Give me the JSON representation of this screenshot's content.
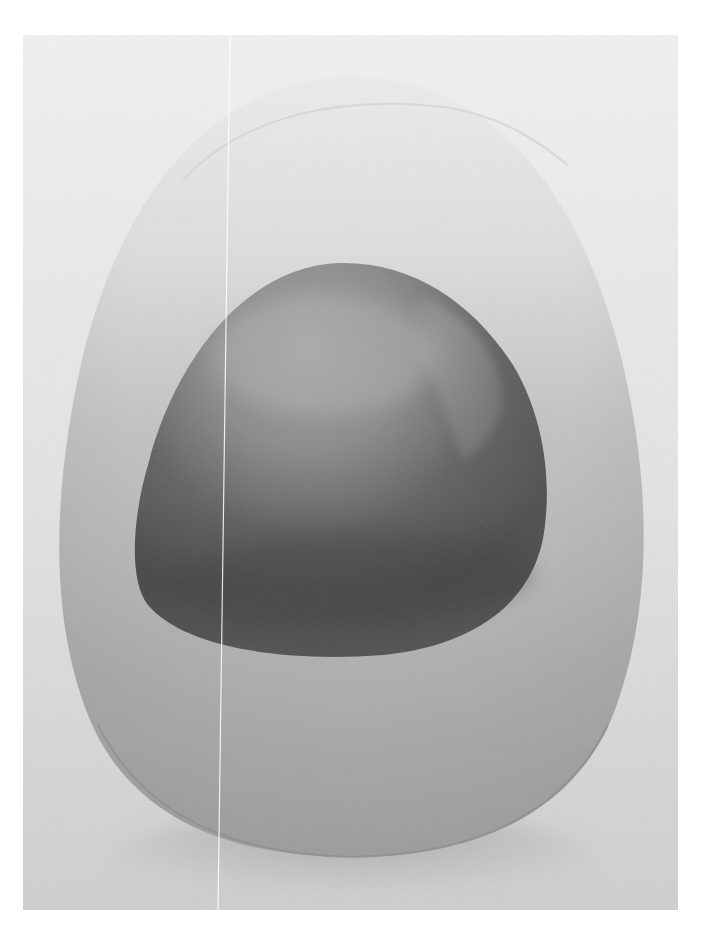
{
  "artwork": {
    "subject": "painting of an egg form containing a darker rounded shape",
    "palette": {
      "background_light": "#eeeeee",
      "background_mid": "#d9d9d9",
      "egg_top": "#e6e6e6",
      "egg_mid": "#bcbcbc",
      "egg_bottom": "#a9a9a9",
      "shadow": "#8f8f8f",
      "inner_light": "#9a9a9a",
      "inner_mid": "#6e6e6e",
      "inner_dark": "#4a4a4a",
      "scan_line": "#ffffff"
    }
  }
}
